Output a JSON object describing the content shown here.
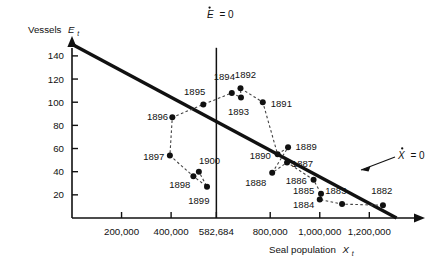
{
  "figure": {
    "type": "phase-plane-scatter",
    "y_axis_title_main": "Vessels",
    "y_axis_title_var": "E",
    "y_axis_title_sub": "t",
    "x_axis_title_main": "Seal population",
    "x_axis_title_var": "X",
    "x_axis_title_sub": "t"
  },
  "annotations": {
    "e_isocline": {
      "var": "E",
      "equals": "= 0",
      "full": "Ė = 0"
    },
    "x_isocline": {
      "var": "X",
      "equals": "= 0",
      "full": "Ẋ = 0"
    }
  },
  "chart_data": {
    "type": "scatter",
    "title": "",
    "xlabel": "Seal population X_t",
    "ylabel": "Vessels E_t",
    "xlim": [
      0,
      1340000
    ],
    "ylim": [
      0,
      152
    ],
    "grid": false,
    "legend": "none",
    "x_ticks": [
      "200,000",
      "400,000",
      "582,684",
      "800,000",
      "1,000,000",
      "1,200,000"
    ],
    "x_tick_values": [
      200000,
      400000,
      582684,
      800000,
      1000000,
      1200000
    ],
    "y_ticks": [
      "20",
      "40",
      "60",
      "80",
      "100",
      "120",
      "140"
    ],
    "y_tick_values": [
      20,
      40,
      60,
      80,
      100,
      120,
      140
    ],
    "points": [
      {
        "label": "1882",
        "x": 1255000,
        "y": 11,
        "lx": 1250000,
        "ly": 24,
        "anchor": "middle"
      },
      {
        "label": "1883",
        "x": 1090000,
        "y": 12,
        "lx": 1065000,
        "ly": 24,
        "anchor": "middle"
      },
      {
        "label": "1884",
        "x": 1000000,
        "y": 16,
        "lx": 935000,
        "ly": 12,
        "anchor": "middle"
      },
      {
        "label": "1885",
        "x": 1005000,
        "y": 21,
        "lx": 935000,
        "ly": 24,
        "anchor": "middle"
      },
      {
        "label": "1886",
        "x": 975000,
        "y": 33,
        "lx": 905000,
        "ly": 32,
        "anchor": "middle"
      },
      {
        "label": "1887",
        "x": 868000,
        "y": 48,
        "lx": 930000,
        "ly": 47,
        "anchor": "middle"
      },
      {
        "label": "1888",
        "x": 808000,
        "y": 39,
        "lx": 742000,
        "ly": 31,
        "anchor": "middle"
      },
      {
        "label": "1889",
        "x": 872000,
        "y": 61,
        "lx": 945000,
        "ly": 62,
        "anchor": "middle"
      },
      {
        "label": "1890",
        "x": 830000,
        "y": 55,
        "lx": 760000,
        "ly": 54,
        "anchor": "middle"
      },
      {
        "label": "1891",
        "x": 770000,
        "y": 100,
        "lx": 845000,
        "ly": 99,
        "anchor": "middle"
      },
      {
        "label": "1892",
        "x": 680000,
        "y": 112,
        "lx": 700000,
        "ly": 124,
        "anchor": "middle"
      },
      {
        "label": "1893",
        "x": 682000,
        "y": 104,
        "lx": 672000,
        "ly": 92,
        "anchor": "middle"
      },
      {
        "label": "1894",
        "x": 645000,
        "y": 108,
        "lx": 615000,
        "ly": 122,
        "anchor": "middle"
      },
      {
        "label": "1895",
        "x": 530000,
        "y": 98,
        "lx": 495000,
        "ly": 109,
        "anchor": "middle"
      },
      {
        "label": "1896",
        "x": 405000,
        "y": 87,
        "lx": 345000,
        "ly": 88,
        "anchor": "middle"
      },
      {
        "label": "1897",
        "x": 395000,
        "y": 54,
        "lx": 330000,
        "ly": 53,
        "anchor": "middle"
      },
      {
        "label": "1898",
        "x": 490000,
        "y": 36,
        "lx": 435000,
        "ly": 29,
        "anchor": "middle"
      },
      {
        "label": "1899",
        "x": 545000,
        "y": 27,
        "lx": 512000,
        "ly": 15,
        "anchor": "middle"
      },
      {
        "label": "1900",
        "x": 512000,
        "y": 40,
        "lx": 555000,
        "ly": 50,
        "anchor": "middle"
      }
    ],
    "trajectory_order": [
      "1882",
      "1883",
      "1884",
      "1885",
      "1886",
      "1887",
      "1888",
      "1889",
      "1890",
      "1891",
      "1892",
      "1893",
      "1894",
      "1895",
      "1896",
      "1897",
      "1898",
      "1899",
      "1900"
    ],
    "lines": [
      {
        "name": "X-dot = 0 isocline",
        "style": "thick-solid",
        "from": {
          "x": 0,
          "y": 150
        },
        "to": {
          "x": 1310000,
          "y": 0
        }
      },
      {
        "name": "E-dot = 0 isocline",
        "style": "thin-vertical",
        "x": 582684,
        "y_from": 0,
        "y_to": 147
      }
    ]
  }
}
